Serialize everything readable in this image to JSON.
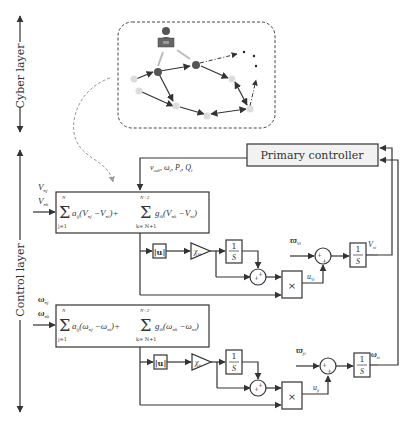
{
  "layers": {
    "cyber": "Cyber layer",
    "control": "Control layer"
  },
  "primary_controller": {
    "label": "Primary controller",
    "outputs": "v_odi, ω_i, P_i, Q_i"
  },
  "voltage_loop": {
    "inputs": [
      "V_nj",
      "V_nk"
    ],
    "equation": "Σ(j=1..N) a_ij (V_nj − V_ni) + Σ(k=N+1..N+2) g_ik (V_nk − V_ni)",
    "abs_block": "|u|",
    "gain": "χ_Vi",
    "integrator": "1/S",
    "sum_signs": "+ +",
    "multiplier": "×",
    "control_signal": "u_Vi",
    "reference": "ϖ_Vi",
    "output": "V_ni"
  },
  "frequency_loop": {
    "inputs": [
      "ω_nj",
      "ω_nk"
    ],
    "equation": "Σ(j=1..N) a_ij (ω_nj − ω_ni) + Σ(k=N+1..N+2) g_ik (ω_nk − ω_ni)",
    "abs_block": "|u|",
    "gain": "χ_fi",
    "integrator": "1/S",
    "sum_signs": "+ +",
    "multiplier": "×",
    "control_signal": "u_fi",
    "reference": "ϖ_fi",
    "output": "ω_ni"
  },
  "labels": {
    "sum_upper_N": "N",
    "sum_lower_j": "j=1",
    "sum_upper_N2": "N+2",
    "sum_lower_k": "k= N+1",
    "one": "1",
    "S": "S",
    "abs_u": "|u|",
    "times": "×",
    "plus": "+",
    "chi": "χ",
    "chi_V_sub": "Vi",
    "chi_f_sub": "fi",
    "V_nj": "V",
    "V_nj_sub": "nj",
    "V_nk_sub": "nk",
    "w_nj": "ω",
    "w_nj_sub": "nj",
    "w_nk_sub": "nk",
    "u": "u",
    "u_V_sub": "Vi",
    "u_f_sub": "fi",
    "varpi": "ϖ",
    "varpi_V_sub": "Vi",
    "varpi_f_sub": "fi",
    "V_out": "V",
    "V_out_sub": "ni",
    "w_out": "ω",
    "w_out_sub": "ni",
    "eqV_a": "a",
    "eqV_a_sub": "ij",
    "eqV_p1": "(V",
    "eqV_nj_sub": "nj",
    "eqV_minus": " −V",
    "eqV_ni_sub": "ni",
    "eqV_close_plus": ")+",
    "eqV_g": "g",
    "eqV_g_sub": "ik",
    "eqV_nk_sub": "nk",
    "eqV_close": ")",
    "eqF_p1": "(ω",
    "eqF_minus": " −ω",
    "pc_out_v": "v",
    "pc_out_v_sub": "odi",
    "pc_out_w": ", ω",
    "pc_out_w_sub": "i",
    "pc_out_P": ", P",
    "pc_out_P_sub": "i",
    "pc_out_Q": ", Q",
    "pc_out_Q_sub": "i"
  },
  "colors": {
    "line": "#333333",
    "node_dark": "#555555",
    "node_light": "#dddddd",
    "box_fill": "#f2f2f2",
    "dashed": "#999999"
  }
}
